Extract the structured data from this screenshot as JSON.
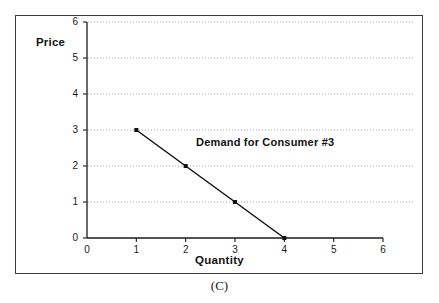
{
  "figure": {
    "caption": "(C)"
  },
  "chart_data": {
    "type": "line",
    "title": "",
    "xlabel": "Quantity",
    "ylabel": "Price",
    "xlim": [
      0,
      6
    ],
    "ylim": [
      0,
      6
    ],
    "xticks": [
      "0",
      "1",
      "2",
      "3",
      "4",
      "5",
      "6"
    ],
    "yticks": [
      "0",
      "1",
      "2",
      "3",
      "4",
      "5",
      "6"
    ],
    "grid": "horizontal-dotted",
    "legend": "none",
    "annotations": [
      {
        "text": "Demand for Consumer #3",
        "x": 2.15,
        "y": 2.45
      }
    ],
    "series": [
      {
        "name": "Demand for Consumer #3",
        "x": [
          1,
          2,
          3,
          4
        ],
        "values": [
          3,
          2,
          1,
          0
        ],
        "marker": "square",
        "color": "#111111"
      }
    ]
  },
  "colors": {
    "line": "#111111",
    "grid": "#9a9a9a",
    "axis": "#1a1a1a",
    "border": "#3a3a40"
  }
}
